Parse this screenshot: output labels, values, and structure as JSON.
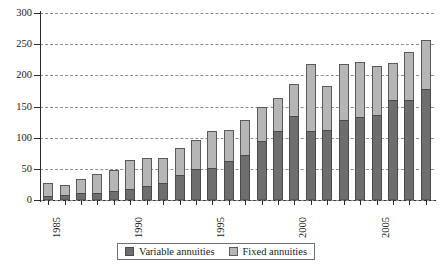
{
  "chart_data": {
    "type": "bar",
    "stacked": true,
    "title": "",
    "subtitle": "",
    "xlabel": "",
    "ylabel": "",
    "ylim": [
      0,
      300
    ],
    "yticks": [
      0,
      50,
      100,
      150,
      200,
      250,
      300
    ],
    "ytick_labels": [
      "0",
      "50",
      "100",
      "150",
      "200",
      "250",
      "300"
    ],
    "grid": true,
    "grid_axis": "y",
    "grid_style": "dashed",
    "legend_position": "bottom-center",
    "categories": [
      "1985",
      "1986",
      "1987",
      "1988",
      "1989",
      "1990",
      "1991",
      "1992",
      "1993",
      "1994",
      "1995",
      "1996",
      "1997",
      "1998",
      "1999",
      "2000",
      "2001",
      "2002",
      "2003",
      "2004",
      "2005",
      "2006",
      "2007",
      "2008"
    ],
    "xtick_labels_shown": [
      "1985",
      "1990",
      "1995",
      "2000",
      "2005"
    ],
    "series": [
      {
        "name": "Variable annuities",
        "color": "#6e6e6e",
        "values": [
          7,
          8,
          11,
          12,
          15,
          18,
          22,
          28,
          40,
          50,
          51,
          62,
          72,
          95,
          110,
          134,
          110,
          113,
          128,
          133,
          137,
          160,
          160,
          178
        ]
      },
      {
        "name": "Fixed annuities",
        "color": "#b6b6b6",
        "values": [
          20,
          16,
          22,
          29,
          33,
          46,
          45,
          40,
          44,
          47,
          60,
          50,
          57,
          55,
          53,
          52,
          108,
          70,
          91,
          88,
          78,
          60,
          78,
          78
        ]
      }
    ],
    "totals": [
      27,
      24,
      33,
      41,
      48,
      64,
      67,
      68,
      84,
      97,
      111,
      112,
      129,
      150,
      163,
      186,
      218,
      183,
      219,
      221,
      215,
      220,
      238,
      256
    ]
  },
  "legend": {
    "items": [
      {
        "label": "Variable annuities",
        "swatch": "dark-gray-swatch"
      },
      {
        "label": "Fixed annuities",
        "swatch": "light-gray-swatch"
      }
    ]
  }
}
